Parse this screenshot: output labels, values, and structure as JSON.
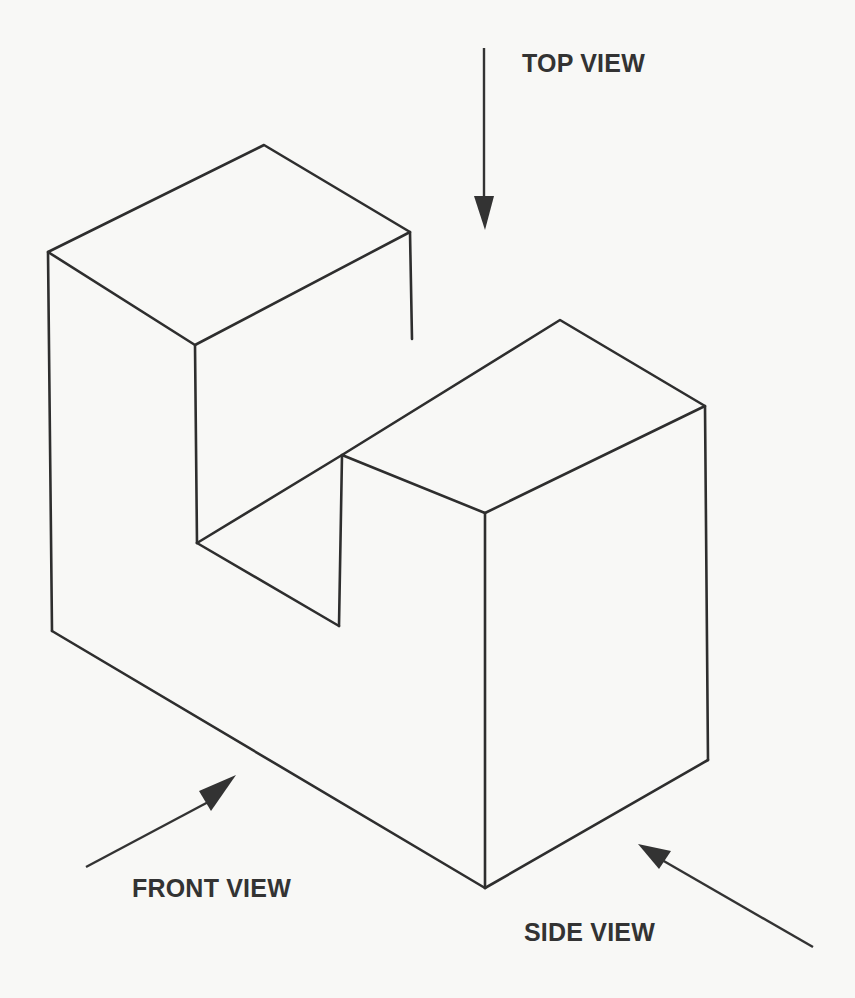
{
  "labels": {
    "top_view": "TOP VIEW",
    "front_view": "FRONT VIEW",
    "side_view": "SIDE VIEW"
  },
  "colors": {
    "ink": "#2e2e2e",
    "paper": "#f8f8f6",
    "label": "#333333"
  }
}
